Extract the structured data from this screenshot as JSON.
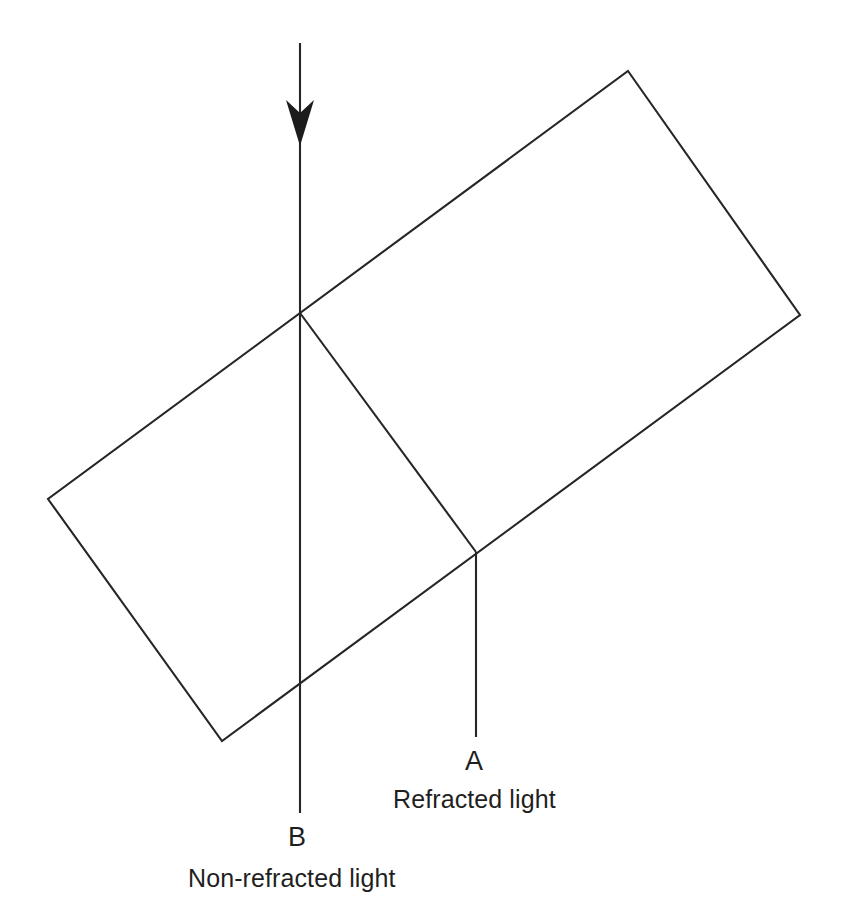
{
  "diagram": {
    "background_color": "#ffffff",
    "stroke_color": "#262626",
    "arrow_fill_color": "#1c1c1c",
    "canvas": {
      "width": 843,
      "height": 921
    },
    "labels": {
      "point_a": "A",
      "point_b": "B",
      "refracted_caption": "Refracted light",
      "nonrefracted_caption": "Non-refracted light"
    },
    "shapes": {
      "block": {
        "name": "tilted-rectangular-block",
        "corners": {
          "top": [
            628,
            71
          ],
          "right": [
            800,
            315
          ],
          "bottom": [
            222,
            741
          ],
          "left": [
            48,
            499
          ]
        },
        "points_attr": "628,71 800,315 222,741 48,499"
      },
      "incident_ray": {
        "name": "incident-light-ray",
        "from": [
          300,
          43
        ],
        "to": [
          300,
          313
        ],
        "path_attr": "M 300 43 L 300 313"
      },
      "nonrefracted_ray": {
        "name": "non-refracted-ray-b",
        "from": [
          300,
          313
        ],
        "to": [
          300,
          813
        ],
        "path_attr": "M 300 313 L 300 813"
      },
      "refracted_ray_inside": {
        "name": "refracted-ray-inside-block",
        "from": [
          300,
          313
        ],
        "to": [
          476,
          552
        ],
        "path_attr": "M 300 313 L 476 552"
      },
      "refracted_ray_exit": {
        "name": "refracted-ray-exit-a",
        "from": [
          476,
          552
        ],
        "to": [
          476,
          737
        ],
        "path_attr": "M 476 552 L 476 737"
      },
      "arrow_head": {
        "name": "downward-arrowhead",
        "tip": [
          300,
          146
        ],
        "points_attr": "300,146 286,100 300,113 314,100"
      }
    }
  }
}
